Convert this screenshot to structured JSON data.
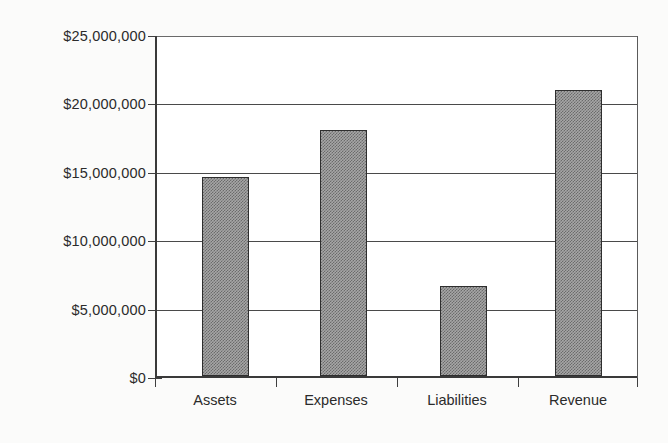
{
  "chart_data": {
    "type": "bar",
    "title": "",
    "subtitle": "",
    "xlabel": "",
    "ylabel": "",
    "categories": [
      "Assets",
      "Expenses",
      "Liabilities",
      "Revenue"
    ],
    "values": [
      14600000,
      18100000,
      6600000,
      21000000
    ],
    "value_labels": [
      "$14,600,000",
      "$18,100,000",
      "$6,600,000",
      "$21,000,000"
    ],
    "ylim": [
      0,
      25000000
    ],
    "ytick_values": [
      0,
      5000000,
      10000000,
      15000000,
      20000000,
      25000000
    ],
    "ytick_labels": [
      "$0",
      "$5,000,000",
      "$10,000,000",
      "$15,000,000",
      "$20,000,000",
      "$25,000,000"
    ],
    "grid": true,
    "grid_axis": "y",
    "legend": false,
    "legend_position": "none",
    "series": [
      {
        "name": "",
        "values": [
          14600000,
          18100000,
          6600000,
          21000000
        ]
      }
    ],
    "colors": {
      "bar_fill": "#a6a6a6",
      "bar_border": "#2e2e2e",
      "gridline": "#4a4a4a",
      "axis": "#3a3a3a",
      "text": "#2b2b2b",
      "plot_background": "#ffffff",
      "page_background": "#fbfbfa"
    }
  }
}
